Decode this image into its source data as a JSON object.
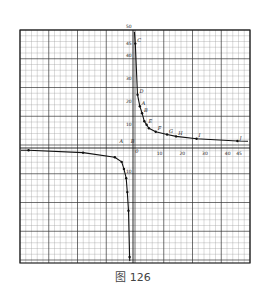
{
  "caption": "图 126",
  "colors": {
    "grid_minor": "#9a9a9a",
    "grid_major": "#333333",
    "curve": "#111111",
    "frame": "#222222"
  },
  "chart_data": {
    "type": "line",
    "title": "",
    "xlabel": "",
    "ylabel": "",
    "grid": true,
    "xlim": [
      -50,
      52
    ],
    "ylim": [
      -50,
      52
    ],
    "x_ticks": [
      {
        "value": 10,
        "label": "10"
      },
      {
        "value": 20,
        "label": "20"
      },
      {
        "value": 30,
        "label": "30"
      },
      {
        "value": 40,
        "label": "40"
      },
      {
        "value": 45,
        "label": "45"
      }
    ],
    "y_ticks": [
      {
        "value": 50,
        "label": "50"
      },
      {
        "value": 45,
        "label": "45"
      },
      {
        "value": 40,
        "label": "40"
      },
      {
        "value": 30,
        "label": "30"
      },
      {
        "value": 20,
        "label": "20"
      },
      {
        "value": 10,
        "label": "10"
      },
      {
        "value": -10,
        "label": "10"
      }
    ],
    "axis_marks": [
      {
        "x": -6,
        "y": 2,
        "label": "A"
      },
      {
        "x": -1,
        "y": 2,
        "label": "B"
      },
      {
        "x": 1,
        "y": -2,
        "label": "0"
      }
    ],
    "series": [
      {
        "name": "right-branch",
        "points": [
          {
            "x": 1,
            "y": 45,
            "label": "C"
          },
          {
            "x": 2,
            "y": 23,
            "label": "D"
          },
          {
            "x": 3,
            "y": 18,
            "label": "A"
          },
          {
            "x": 4,
            "y": 15,
            "label": "B"
          },
          {
            "x": 5,
            "y": 11.5,
            "label": ""
          },
          {
            "x": 6,
            "y": 10,
            "label": "E"
          },
          {
            "x": 7,
            "y": 8.5,
            "label": ""
          },
          {
            "x": 10,
            "y": 7,
            "label": "F"
          },
          {
            "x": 15,
            "y": 5.8,
            "label": "G"
          },
          {
            "x": 19,
            "y": 5,
            "label": "H"
          },
          {
            "x": 28,
            "y": 4,
            "label": "I"
          },
          {
            "x": 46,
            "y": 3,
            "label": "J"
          }
        ]
      },
      {
        "name": "left-branch",
        "points": [
          {
            "x": -46,
            "y": -1,
            "label": ""
          },
          {
            "x": -22,
            "y": -2,
            "label": ""
          },
          {
            "x": -8,
            "y": -4,
            "label": ""
          },
          {
            "x": -5,
            "y": -6,
            "label": ""
          },
          {
            "x": -4,
            "y": -9,
            "label": ""
          },
          {
            "x": -3,
            "y": -13,
            "label": ""
          },
          {
            "x": -2.5,
            "y": -19,
            "label": ""
          },
          {
            "x": -2,
            "y": -27,
            "label": ""
          },
          {
            "x": -1.5,
            "y": -47,
            "label": ""
          }
        ]
      }
    ]
  }
}
